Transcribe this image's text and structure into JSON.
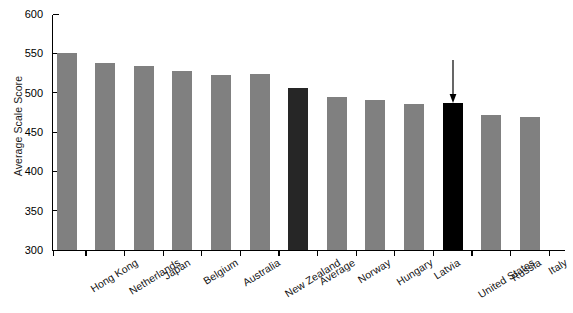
{
  "chart_data": {
    "type": "bar",
    "title": "",
    "xlabel": "",
    "ylabel": "Average Scale Score",
    "ylim": [
      300,
      600
    ],
    "ytick_labels": [
      "600",
      "550",
      "500",
      "450",
      "400",
      "350",
      "300"
    ],
    "yticks": [
      600,
      550,
      500,
      450,
      400,
      350,
      300
    ],
    "grid": false,
    "legend": "none",
    "categories": [
      "Hong Kong",
      "Netherlands",
      "Japan",
      "Belgium",
      "Australia",
      "New Zealand",
      "Average",
      "Norway",
      "Hungary",
      "Latvia",
      "United States",
      "Russia",
      "Italy"
    ],
    "values": [
      550,
      538,
      534,
      528,
      523,
      524,
      506,
      495,
      491,
      486,
      487,
      471,
      469
    ],
    "bar_colors": [
      "#808080",
      "#808080",
      "#808080",
      "#808080",
      "#808080",
      "#808080",
      "#262626",
      "#808080",
      "#808080",
      "#808080",
      "#000000",
      "#808080",
      "#808080"
    ],
    "annotations": [
      {
        "type": "down-arrow",
        "target_category": "United States",
        "note": "arrow pointing down at the United States bar"
      }
    ],
    "colors": {
      "bar_default": "#808080",
      "bar_average": "#262626",
      "bar_highlight": "#000000",
      "axis": "#000000",
      "background": "#ffffff",
      "text": "#121212"
    }
  }
}
